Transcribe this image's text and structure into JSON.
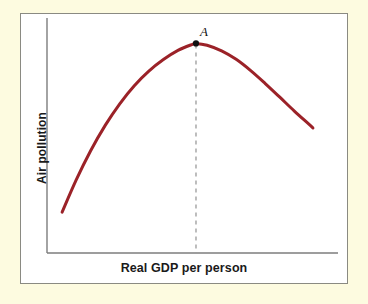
{
  "figure": {
    "kind": "economics-textbook-figure",
    "background_color": "#fdfbe0",
    "panel_background": "#ffffff",
    "panel_border_color": "#8a8a82"
  },
  "axes": {
    "y_title": "Air pollution",
    "x_title": "Real GDP per person",
    "axis_line_color": "#7d7d7d",
    "y_axis_x": 47,
    "x_axis_y": 253,
    "x_axis_end": 338,
    "y_axis_top": 18
  },
  "annotations": {
    "peak_label": "A",
    "peak_marker_color": "#111111",
    "dashed_line_color": "#9a9a9a"
  },
  "chart_data": {
    "type": "line",
    "title": "",
    "subtitle": "",
    "xlabel": "Real GDP per person",
    "ylabel": "Air pollution",
    "xlim": [
      0,
      100
    ],
    "ylim": [
      0,
      100
    ],
    "grid": false,
    "legend": null,
    "axis_ticks": {
      "x": [],
      "y": []
    },
    "series": [
      {
        "name": "Environmental Kuznets curve",
        "color": "#9b2228",
        "line_width": 3,
        "points": [
          {
            "x": 5.2,
            "y": 17.4
          },
          {
            "x": 10.0,
            "y": 31.0
          },
          {
            "x": 15.0,
            "y": 43.5
          },
          {
            "x": 20.0,
            "y": 54.3
          },
          {
            "x": 25.0,
            "y": 63.5
          },
          {
            "x": 30.0,
            "y": 71.2
          },
          {
            "x": 35.0,
            "y": 77.4
          },
          {
            "x": 40.0,
            "y": 82.3
          },
          {
            "x": 45.0,
            "y": 86.2
          },
          {
            "x": 50.0,
            "y": 88.8
          },
          {
            "x": 51.2,
            "y": 89.2
          },
          {
            "x": 55.0,
            "y": 88.4
          },
          {
            "x": 60.0,
            "y": 86.0
          },
          {
            "x": 65.0,
            "y": 82.4
          },
          {
            "x": 70.0,
            "y": 77.6
          },
          {
            "x": 75.0,
            "y": 72.1
          },
          {
            "x": 80.0,
            "y": 66.3
          },
          {
            "x": 85.0,
            "y": 60.4
          },
          {
            "x": 90.0,
            "y": 54.8
          },
          {
            "x": 91.4,
            "y": 53.2
          }
        ]
      }
    ],
    "annotations": [
      {
        "label": "A",
        "kind": "maximum-point",
        "x": 51.2,
        "y": 89.2,
        "dropline": "dashed-to-x-axis"
      }
    ]
  }
}
